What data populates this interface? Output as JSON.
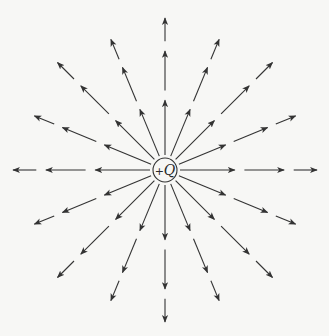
{
  "diagram": {
    "charge": {
      "sign": "+",
      "symbol": "Q",
      "center": [
        165,
        170
      ],
      "radius": 12
    },
    "field_lines": {
      "count": 16,
      "angle_step_deg": 22.5,
      "direction": "outward",
      "inner_radius": 15,
      "outer_radius": 152,
      "segments_per_line": 3,
      "arrowheads_per_line": 3
    },
    "colors": {
      "background": "#f7f7f5",
      "line": "#333333"
    }
  }
}
